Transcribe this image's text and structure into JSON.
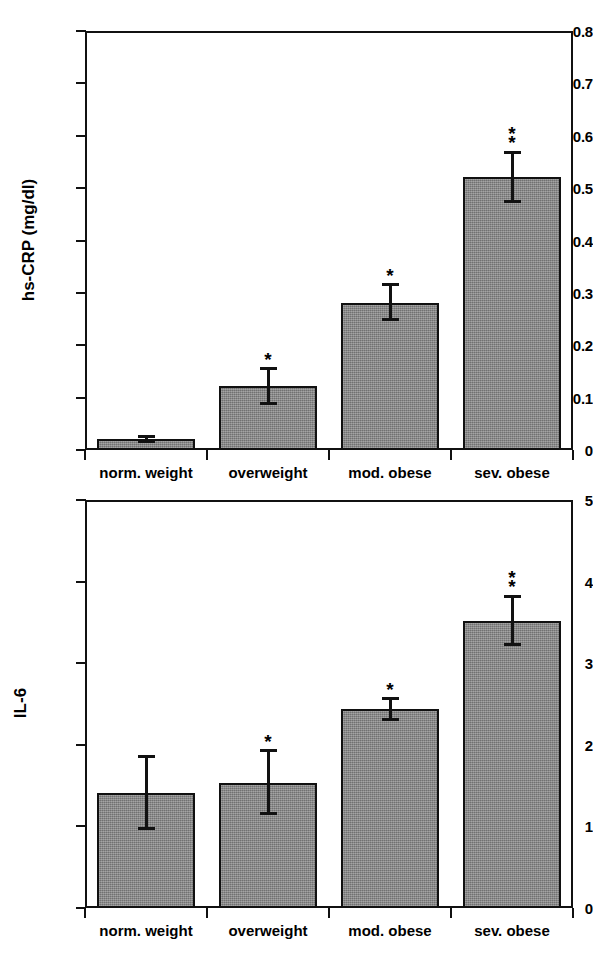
{
  "chart_data": [
    {
      "type": "bar",
      "id": "hs-crp",
      "title": "",
      "xlabel": "",
      "ylabel": "hs-CRP (mg/dl)",
      "categories": [
        "norm. weight",
        "overweight",
        "mod. obese",
        "sev. obese"
      ],
      "values": [
        0.021,
        0.122,
        0.281,
        0.521
      ],
      "errors_upper": [
        0.029,
        0.158,
        0.318,
        0.57
      ],
      "errors_lower": [
        0.014,
        0.085,
        0.246,
        0.472
      ],
      "annotations": [
        "",
        "*",
        "*",
        "**"
      ],
      "ylim": [
        0,
        0.8
      ],
      "yticks": [
        "0",
        "0.1",
        "0.2",
        "0.3",
        "0.4",
        "0.5",
        "0.6",
        "0.7",
        "0.8"
      ],
      "ytick_values": [
        0,
        0.1,
        0.2,
        0.3,
        0.4,
        0.5,
        0.6,
        0.7,
        0.8
      ],
      "grid": false,
      "legend": "none",
      "bar_color": "#8b8b8b",
      "line_color": "#111111"
    },
    {
      "type": "bar",
      "id": "il-6",
      "title": "",
      "xlabel": "",
      "ylabel": "IL-6",
      "categories": [
        "norm. weight",
        "overweight",
        "mod. obese",
        "sev. obese"
      ],
      "values": [
        1.41,
        1.53,
        2.44,
        3.52
      ],
      "errors_upper": [
        1.88,
        1.95,
        2.58,
        3.84
      ],
      "errors_lower": [
        0.95,
        1.14,
        2.29,
        3.21
      ],
      "annotations": [
        "",
        "*",
        "*",
        "**"
      ],
      "ylim": [
        0,
        5
      ],
      "yticks": [
        "0",
        "1",
        "2",
        "3",
        "4",
        "5"
      ],
      "ytick_values": [
        0,
        1,
        2,
        3,
        4,
        5
      ],
      "grid": false,
      "legend": "none",
      "bar_color": "#8b8b8b",
      "line_color": "#111111"
    }
  ]
}
